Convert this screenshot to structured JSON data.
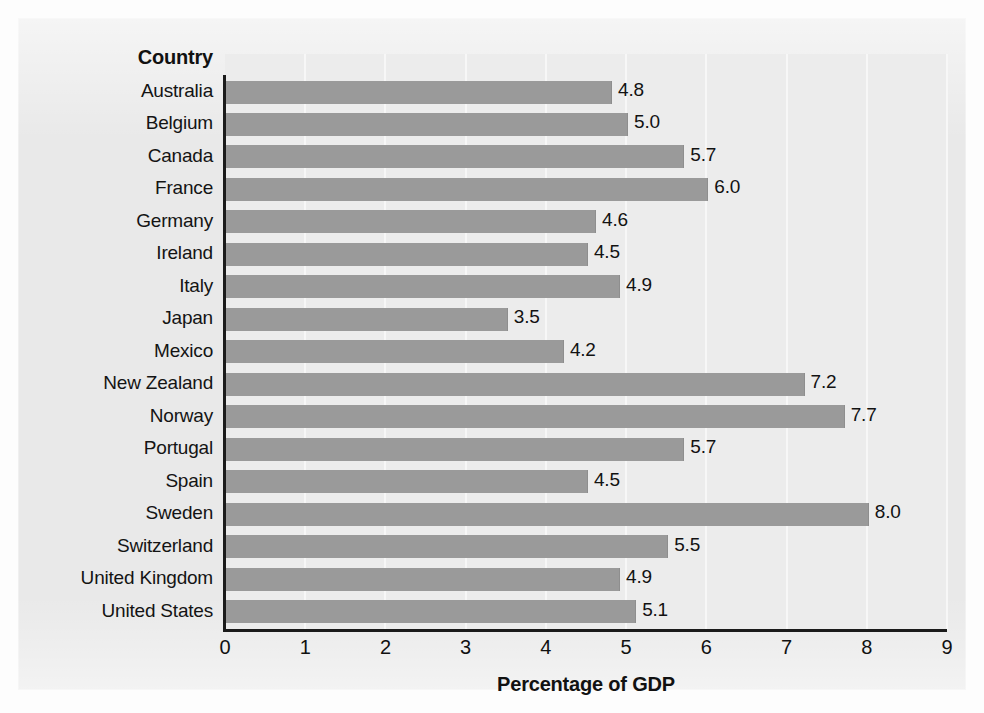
{
  "chart_data": {
    "type": "bar",
    "orientation": "horizontal",
    "title": "",
    "xlabel": "Percentage of GDP",
    "ylabel": "Country",
    "xlim": [
      0,
      9
    ],
    "xticks": [
      "0",
      "1",
      "2",
      "3",
      "4",
      "5",
      "6",
      "7",
      "8",
      "9"
    ],
    "grid": true,
    "grid_axis": "x",
    "legend": false,
    "categories": [
      "Australia",
      "Belgium",
      "Canada",
      "France",
      "Germany",
      "Ireland",
      "Italy",
      "Japan",
      "Mexico",
      "New Zealand",
      "Norway",
      "Portugal",
      "Spain",
      "Sweden",
      "Switzerland",
      "United Kingdom",
      "United States"
    ],
    "values": [
      4.8,
      5.0,
      5.7,
      6.0,
      4.6,
      4.5,
      4.9,
      3.5,
      4.2,
      7.2,
      7.7,
      5.7,
      4.5,
      8.0,
      5.5,
      4.9,
      5.1
    ],
    "value_labels": [
      "4.8",
      "5.0",
      "5.7",
      "6.0",
      "4.6",
      "4.5",
      "4.9",
      "3.5",
      "4.2",
      "7.2",
      "7.7",
      "5.7",
      "4.5",
      "8.0",
      "5.5",
      "4.9",
      "5.1"
    ],
    "bars": [
      {
        "category": "Australia",
        "value": 4.8,
        "label": "4.8"
      },
      {
        "category": "Belgium",
        "value": 5.0,
        "label": "5.0"
      },
      {
        "category": "Canada",
        "value": 5.7,
        "label": "5.7"
      },
      {
        "category": "France",
        "value": 6.0,
        "label": "6.0"
      },
      {
        "category": "Germany",
        "value": 4.6,
        "label": "4.6"
      },
      {
        "category": "Ireland",
        "value": 4.5,
        "label": "4.5"
      },
      {
        "category": "Italy",
        "value": 4.9,
        "label": "4.9"
      },
      {
        "category": "Japan",
        "value": 3.5,
        "label": "3.5"
      },
      {
        "category": "Mexico",
        "value": 4.2,
        "label": "4.2"
      },
      {
        "category": "New Zealand",
        "value": 7.2,
        "label": "7.2"
      },
      {
        "category": "Norway",
        "value": 7.7,
        "label": "7.7"
      },
      {
        "category": "Portugal",
        "value": 5.7,
        "label": "5.7"
      },
      {
        "category": "Spain",
        "value": 4.5,
        "label": "4.5"
      },
      {
        "category": "Sweden",
        "value": 8.0,
        "label": "8.0"
      },
      {
        "category": "Switzerland",
        "value": 5.5,
        "label": "5.5"
      },
      {
        "category": "United Kingdom",
        "value": 4.9,
        "label": "4.9"
      },
      {
        "category": "United States",
        "value": 5.1,
        "label": "5.1"
      }
    ],
    "colors": {
      "bar": "#9a9a9a",
      "panel_background": "#e9e9e9",
      "plot_background": "#ececec",
      "gridline": "#f7f7f7",
      "axis": "#1b1b1b",
      "text": "#111111"
    }
  }
}
